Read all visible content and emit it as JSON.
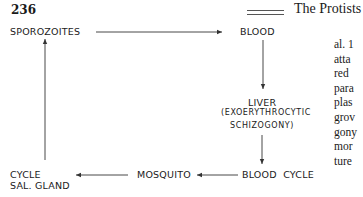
{
  "header": {
    "page_number": "236",
    "title": "The Protists"
  },
  "diagram": {
    "nodes": {
      "sporozoites": "SPOROZOITES",
      "blood": "BLOOD",
      "liver": "LIVER",
      "liver_sub1": "(EXOERYTHROCYTIC",
      "liver_sub2": "SCHIZOGONY)",
      "blood_cycle": "BLOOD  CYCLE",
      "mosquito": "MOSQUITO",
      "cycle": "CYCLE",
      "sal_gland": "SAL. GLAND"
    },
    "edges": [
      {
        "from": "SPOROZOITES",
        "to": "BLOOD"
      },
      {
        "from": "BLOOD",
        "to": "LIVER"
      },
      {
        "from": "LIVER",
        "to": "BLOOD CYCLE"
      },
      {
        "from": "BLOOD CYCLE",
        "to": "MOSQUITO"
      },
      {
        "from": "MOSQUITO",
        "to": "CYCLE SAL. GLAND"
      },
      {
        "from": "CYCLE SAL. GLAND",
        "to": "SPOROZOITES"
      }
    ]
  },
  "body_text": {
    "lines": [
      "al. 1",
      "atta",
      "red",
      "para",
      "plas",
      "grov",
      "gony",
      "mor",
      "ture"
    ]
  }
}
